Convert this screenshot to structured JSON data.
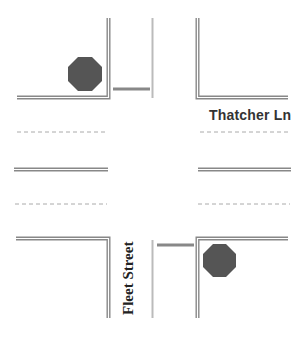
{
  "diagram": {
    "type": "road-intersection",
    "colors": {
      "curb": "#888888",
      "curb_inner": "#ffffff",
      "center_line": "#bbbbbb",
      "lane_dash": "#aaaaaa",
      "stop_bar": "#888888",
      "stop_sign": "#555555",
      "label_text": "#333333"
    },
    "streets": [
      {
        "name": "Thatcher Ln",
        "orientation": "horizontal"
      },
      {
        "name": "Fleet Street",
        "orientation": "vertical"
      }
    ],
    "stop_signs": [
      {
        "position": "northwest-corner",
        "icon": "stop-sign-octagon"
      },
      {
        "position": "southeast-corner",
        "icon": "stop-sign-octagon"
      }
    ],
    "stop_bars": [
      {
        "position": "north-approach"
      },
      {
        "position": "south-approach"
      }
    ]
  },
  "labels": {
    "horizontal_street": "Thatcher Ln",
    "vertical_street": "Fleet Street"
  }
}
